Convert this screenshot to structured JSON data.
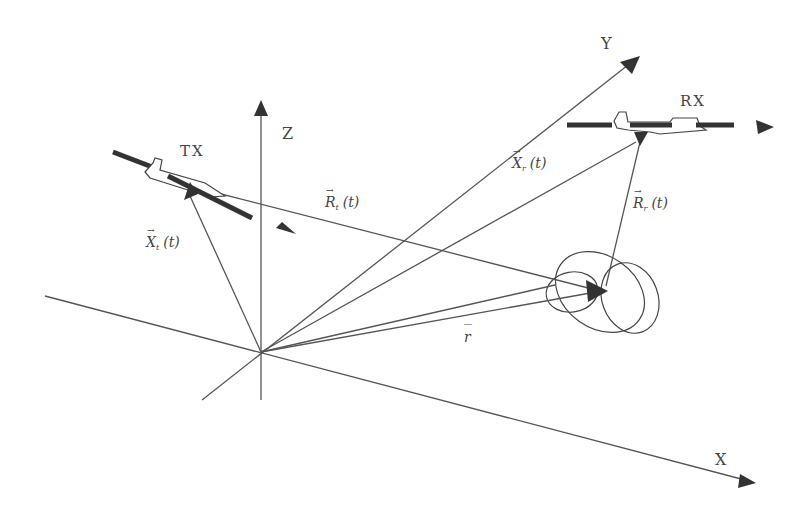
{
  "diagram": {
    "type": "bistatic-geometry-3d",
    "axes": {
      "x": {
        "label": "X"
      },
      "y": {
        "label": "Y"
      },
      "z": {
        "label": "Z"
      }
    },
    "nodes": {
      "transmitter": {
        "label": "TX"
      },
      "receiver": {
        "label": "RX"
      },
      "target": {
        "label": ""
      }
    },
    "vectors": {
      "tx_position": {
        "symbol": "X",
        "subscript": "t",
        "arg": "(t)"
      },
      "rx_position": {
        "symbol": "X",
        "subscript": "r",
        "arg": "(t)"
      },
      "tx_range": {
        "symbol": "R",
        "subscript": "t",
        "arg": "(t)"
      },
      "rx_range": {
        "symbol": "R",
        "subscript": "r",
        "arg": "(t)"
      },
      "target_position": {
        "symbol": "r",
        "subscript": "",
        "arg": ""
      }
    },
    "colors": {
      "line": "#555555",
      "arrow": "#333333",
      "text": "#444444",
      "background": "#ffffff"
    }
  }
}
